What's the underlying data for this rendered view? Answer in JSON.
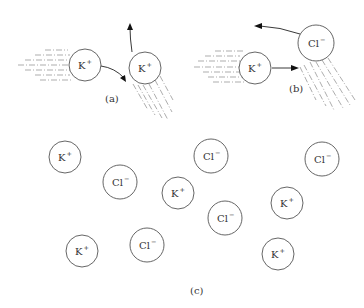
{
  "figure": {
    "panels": [
      {
        "id": "a",
        "label": "(a)",
        "description": "K+ ion colliding with K+ ion; both deflected",
        "ions": [
          {
            "species": "K",
            "charge": "+",
            "cx": 85,
            "cy": 65,
            "r": 16
          },
          {
            "species": "K",
            "charge": "+",
            "cx": 145,
            "cy": 68,
            "r": 16
          }
        ]
      },
      {
        "id": "b",
        "label": "(b)",
        "description": "K+ ion approaching Cl- ion",
        "ions": [
          {
            "species": "K",
            "charge": "+",
            "cx": 255,
            "cy": 68,
            "r": 16
          },
          {
            "species": "Cl",
            "charge": "−",
            "cx": 316,
            "cy": 43,
            "r": 18
          }
        ]
      },
      {
        "id": "c",
        "label": "(c)",
        "description": "Scattered K+ and Cl- ions",
        "ions": [
          {
            "species": "K",
            "charge": "+",
            "cx": 65,
            "cy": 157,
            "r": 16
          },
          {
            "species": "Cl",
            "charge": "−",
            "cx": 120,
            "cy": 182,
            "r": 17
          },
          {
            "species": "K",
            "charge": "+",
            "cx": 178,
            "cy": 193,
            "r": 16
          },
          {
            "species": "Cl",
            "charge": "−",
            "cx": 211,
            "cy": 156,
            "r": 17
          },
          {
            "species": "Cl",
            "charge": "−",
            "cx": 322,
            "cy": 159,
            "r": 17
          },
          {
            "species": "Cl",
            "charge": "−",
            "cx": 225,
            "cy": 218,
            "r": 17
          },
          {
            "species": "K",
            "charge": "+",
            "cx": 287,
            "cy": 203,
            "r": 16
          },
          {
            "species": "K",
            "charge": "+",
            "cx": 82,
            "cy": 251,
            "r": 16
          },
          {
            "species": "Cl",
            "charge": "−",
            "cx": 147,
            "cy": 245,
            "r": 17
          },
          {
            "species": "K",
            "charge": "+",
            "cx": 278,
            "cy": 254,
            "r": 16
          }
        ]
      }
    ]
  },
  "labels": {
    "a": "(a)",
    "b": "(b)",
    "c": "(c)"
  },
  "ions_text": {
    "k_base": "K",
    "k_sup": "+",
    "cl_base": "Cl",
    "cl_sup": "−"
  }
}
